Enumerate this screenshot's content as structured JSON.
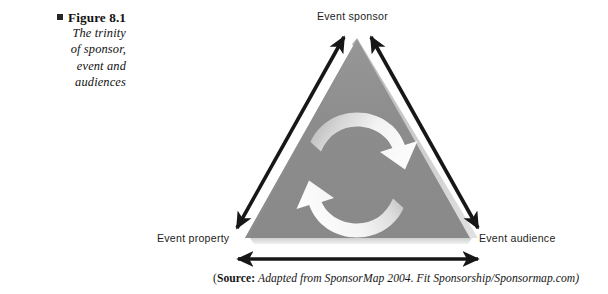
{
  "figure": {
    "bullet_icon": "square-bullet-icon",
    "title": "Figure 8.1",
    "caption_lines": [
      "The trinity",
      "of sponsor,",
      "event and",
      "audiences"
    ]
  },
  "diagram": {
    "type": "triangle-cycle-diagram",
    "nodes": [
      {
        "id": "sponsor",
        "label": "Event sponsor",
        "position": "apex-top"
      },
      {
        "id": "property",
        "label": "Event property",
        "position": "bottom-left"
      },
      {
        "id": "audience",
        "label": "Event audience",
        "position": "bottom-right"
      }
    ],
    "connectors": [
      {
        "id": "sponsor-property",
        "style": "double-headed-arrow",
        "from": "sponsor",
        "to": "property"
      },
      {
        "id": "sponsor-audience",
        "style": "double-headed-arrow",
        "from": "sponsor",
        "to": "audience"
      },
      {
        "id": "property-audience",
        "style": "double-headed-arrow",
        "from": "property",
        "to": "audience"
      }
    ],
    "center_motif": {
      "id": "cycle-arrows",
      "description": "two curved arrows forming a clockwise cycle",
      "arrow_count": 2
    },
    "colors": {
      "triangle_fill": "#8b8b8b",
      "triangle_edge_highlight": "#c9c9c9",
      "triangle_shadow": "#d8d8d8",
      "arrow_black": "#171717",
      "cycle_arrow_light": "#f4f4f4",
      "cycle_arrow_mid": "#b9b9b9",
      "text": "#1d1d1d",
      "background": "#ffffff"
    }
  },
  "source": {
    "open_paren": "(",
    "label": "Source:",
    "text": "Adapted from SponsorMap 2004. Fit Sponsorship/Sponsormap.com)"
  }
}
